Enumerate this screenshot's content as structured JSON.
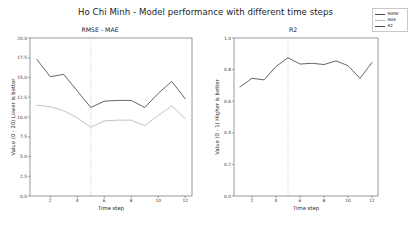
{
  "figure": {
    "suptitle": "Ho Chi Minh - Model performance with different time steps"
  },
  "legend": {
    "position": "top-right",
    "entries": [
      {
        "label": "RMSE",
        "color": "#4a4a4a"
      },
      {
        "label": "MAE",
        "color": "#b8b8b8"
      },
      {
        "label": "R2",
        "color": "#4a4a4a"
      }
    ]
  },
  "panels": {
    "left": {
      "title": "RMSE - MAE",
      "xlabel": "Time step",
      "ylabel": "Value (0 - 20) Lower is better",
      "yticks": [
        "0.0",
        "2.5",
        "5.0",
        "7.5",
        "10.0",
        "12.5",
        "15.0",
        "17.5",
        "20.0"
      ],
      "xticks": [
        "2",
        "4",
        "6",
        "8",
        "10",
        "12"
      ]
    },
    "right": {
      "title": "R2",
      "xlabel": "Time step",
      "ylabel": "Value (0 - 1) Higher is better",
      "yticks": [
        "0.0",
        "0.2",
        "0.4",
        "0.6",
        "0.8",
        "1.0"
      ],
      "xticks": [
        "2",
        "4",
        "6",
        "8",
        "10",
        "12"
      ]
    }
  },
  "chart_data": [
    {
      "type": "line",
      "title": "RMSE - MAE",
      "xlabel": "Time step",
      "ylabel": "Value (0 - 20) Lower is better",
      "x": [
        1,
        2,
        3,
        4,
        5,
        6,
        7,
        8,
        9,
        10,
        11,
        12
      ],
      "xlim": [
        0.5,
        12.5
      ],
      "ylim": [
        0.0,
        20.0
      ],
      "grid": false,
      "annotations": [
        {
          "type": "vline",
          "x": 5,
          "style": "dashed",
          "color": "#b0b0b0"
        }
      ],
      "series": [
        {
          "name": "RMSE",
          "color": "#4a4a4a",
          "values": [
            17.3,
            15.1,
            15.4,
            13.3,
            11.2,
            12.0,
            12.1,
            12.1,
            11.2,
            13.0,
            14.5,
            12.3
          ]
        },
        {
          "name": "MAE",
          "color": "#b8b8b8",
          "values": [
            11.5,
            11.3,
            10.8,
            9.9,
            8.7,
            9.5,
            9.6,
            9.6,
            8.9,
            10.2,
            11.4,
            9.8
          ]
        }
      ]
    },
    {
      "type": "line",
      "title": "R2",
      "xlabel": "Time step",
      "ylabel": "Value (0 - 1) Higher is better",
      "x": [
        1,
        2,
        3,
        4,
        5,
        6,
        7,
        8,
        9,
        10,
        11,
        12
      ],
      "xlim": [
        0.5,
        12.5
      ],
      "ylim": [
        0.0,
        1.0
      ],
      "grid": false,
      "annotations": [
        {
          "type": "vline",
          "x": 5,
          "style": "dashed",
          "color": "#b0b0b0"
        }
      ],
      "series": [
        {
          "name": "R2",
          "color": "#4a4a4a",
          "values": [
            0.69,
            0.745,
            0.735,
            0.82,
            0.875,
            0.835,
            0.84,
            0.832,
            0.855,
            0.825,
            0.745,
            0.845
          ]
        }
      ]
    }
  ]
}
